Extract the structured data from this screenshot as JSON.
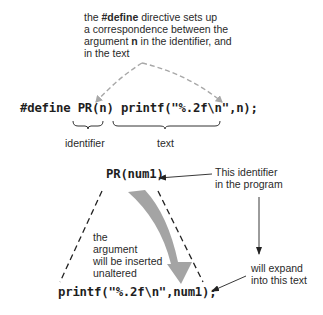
{
  "top_note": {
    "line1_pre": "the ",
    "line1_bold": "#define",
    "line1_post": " directive sets up",
    "line2": "a correspondence between the",
    "line3_pre": "argument ",
    "line3_bold": "n",
    "line3_post": " in the identifier, and",
    "line4": "in the text"
  },
  "define_line": {
    "keyword": "#define",
    "identifier": "PR(n)",
    "text": "printf(\"%.2f\\n\",n);"
  },
  "brace_labels": {
    "identifier": "identifier",
    "text": "text"
  },
  "usage": {
    "call": "PR(num1)",
    "expansion": "printf(\"%.2f\\n\",num1);"
  },
  "annotations": {
    "identifier_note_line1": "This identifier",
    "identifier_note_line2": "in the program",
    "expand_note_line1": "will expand",
    "expand_note_line2": "into this text",
    "argument_note": [
      "the",
      "argument",
      "will be inserted",
      "unaltered"
    ]
  },
  "colors": {
    "text": "#2a2a2a",
    "code": "#1e1e1e",
    "dashed_gray": "#a8a8a8",
    "dashed_black": "#222222",
    "curved_arrow": "#9a9a9a"
  }
}
